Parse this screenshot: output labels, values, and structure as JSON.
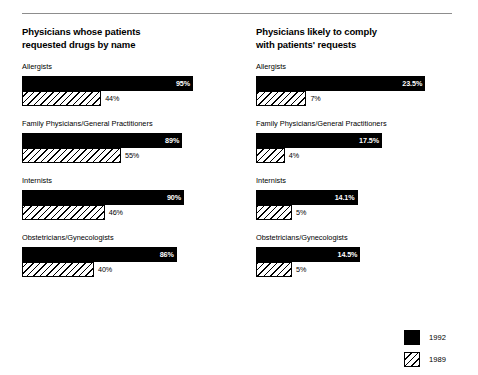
{
  "chart_data": [
    {
      "type": "bar",
      "orientation": "horizontal",
      "title": "Physicians whose patients\nrequested drugs by name",
      "xlabel": "",
      "ylabel": "",
      "xlim": [
        0,
        100
      ],
      "grid": false,
      "categories": [
        "Allergists",
        "Family Physicians/General Practitioners",
        "Internists",
        "Obstetricians/Gynecologists"
      ],
      "series": [
        {
          "name": "1992",
          "values": [
            95,
            89,
            90,
            86
          ],
          "labels": [
            "95%",
            "89%",
            "90%",
            "86%"
          ],
          "style": "solid-black",
          "label_position": "inside-right"
        },
        {
          "name": "1989",
          "values": [
            44,
            55,
            46,
            40
          ],
          "labels": [
            "44%",
            "55%",
            "46%",
            "40%"
          ],
          "style": "diagonal-hatch",
          "label_position": "outside-right"
        }
      ]
    },
    {
      "type": "bar",
      "orientation": "horizontal",
      "title": "Physicians likely to comply\nwith patients' requests",
      "xlabel": "",
      "ylabel": "",
      "xlim": [
        0,
        25
      ],
      "grid": false,
      "categories": [
        "Allergists",
        "Family Physicians/General Practitioners",
        "Internists",
        "Obstetricians/Gynecologists"
      ],
      "series": [
        {
          "name": "1992",
          "values": [
            23.5,
            17.5,
            14.1,
            14.5
          ],
          "labels": [
            "23.5%",
            "17.5%",
            "14.1%",
            "14.5%"
          ],
          "style": "solid-black",
          "label_position": "inside-right"
        },
        {
          "name": "1989",
          "values": [
            7,
            4,
            5,
            5
          ],
          "labels": [
            "7%",
            "4%",
            "5%",
            "5%"
          ],
          "style": "diagonal-hatch",
          "label_position": "outside-right"
        }
      ]
    }
  ],
  "panels": [
    {
      "title": "Physicians whose patients\nrequested drugs by name",
      "bar_area_width": 180,
      "axis_max": 100,
      "groups": [
        {
          "label": "Allergists",
          "bars": [
            {
              "series": "1992",
              "value": 95,
              "label": "95%",
              "style": "solid"
            },
            {
              "series": "1989",
              "value": 44,
              "label": "44%",
              "style": "hatch"
            }
          ]
        },
        {
          "label": "Family Physicians/General Practitioners",
          "bars": [
            {
              "series": "1992",
              "value": 89,
              "label": "89%",
              "style": "solid"
            },
            {
              "series": "1989",
              "value": 55,
              "label": "55%",
              "style": "hatch"
            }
          ]
        },
        {
          "label": "Internists",
          "bars": [
            {
              "series": "1992",
              "value": 90,
              "label": "90%",
              "style": "solid"
            },
            {
              "series": "1989",
              "value": 46,
              "label": "46%",
              "style": "hatch"
            }
          ]
        },
        {
          "label": "Obstetricians/Gynecologists",
          "bars": [
            {
              "series": "1992",
              "value": 86,
              "label": "86%",
              "style": "solid"
            },
            {
              "series": "1989",
              "value": 40,
              "label": "40%",
              "style": "hatch"
            }
          ]
        }
      ]
    },
    {
      "title": "Physicians likely to comply\nwith patients' requests",
      "bar_area_width": 180,
      "axis_max": 25,
      "groups": [
        {
          "label": "Allergists",
          "bars": [
            {
              "series": "1992",
              "value": 23.5,
              "label": "23.5%",
              "style": "solid"
            },
            {
              "series": "1989",
              "value": 7,
              "label": "7%",
              "style": "hatch"
            }
          ]
        },
        {
          "label": "Family Physicians/General Practitioners",
          "bars": [
            {
              "series": "1992",
              "value": 17.5,
              "label": "17.5%",
              "style": "solid"
            },
            {
              "series": "1989",
              "value": 4,
              "label": "4%",
              "style": "hatch"
            }
          ]
        },
        {
          "label": "Internists",
          "bars": [
            {
              "series": "1992",
              "value": 14.1,
              "label": "14.1%",
              "style": "solid"
            },
            {
              "series": "1989",
              "value": 5,
              "label": "5%",
              "style": "hatch"
            }
          ]
        },
        {
          "label": "Obstetricians/Gynecologists",
          "bars": [
            {
              "series": "1992",
              "value": 14.5,
              "label": "14.5%",
              "style": "solid"
            },
            {
              "series": "1989",
              "value": 5,
              "label": "5%",
              "style": "hatch"
            }
          ]
        }
      ]
    }
  ],
  "legend": {
    "position": "bottom-right",
    "items": [
      {
        "label": "1992",
        "style": "solid",
        "color": "#000000"
      },
      {
        "label": "1989",
        "style": "hatch",
        "color": "#000000"
      }
    ]
  },
  "colors": {
    "series_1992": "#000000",
    "series_1989": "#ffffff",
    "hatch_line": "#000000",
    "rule": "#8d8d8d",
    "background": "#ffffff",
    "text": "#000000",
    "inline_label": "#ffffff"
  }
}
